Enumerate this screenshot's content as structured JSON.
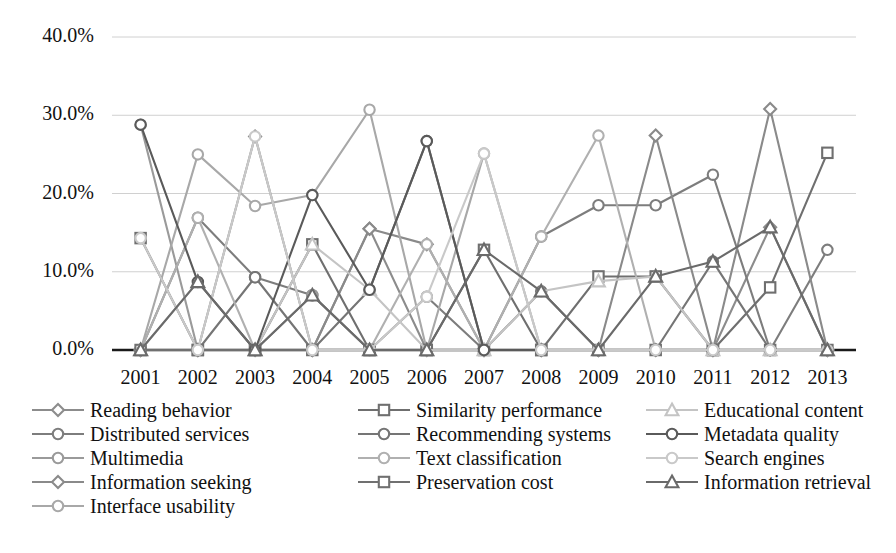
{
  "chart_data": {
    "type": "line",
    "title": "",
    "xlabel": "",
    "ylabel": "",
    "categories": [
      "2001",
      "2002",
      "2003",
      "2004",
      "2005",
      "2006",
      "2007",
      "2008",
      "2009",
      "2010",
      "2011",
      "2012",
      "2013"
    ],
    "ylim": [
      0,
      40
    ],
    "y_ticks": [
      0,
      10,
      20,
      30,
      40
    ],
    "y_tick_labels": [
      "0.0%",
      "10.0%",
      "20.0%",
      "30.0%",
      "40.0%"
    ],
    "grid": true,
    "legend_position": "bottom",
    "value_suffix": "%",
    "series": [
      {
        "name": "Reading behavior",
        "marker": "diamond",
        "color": "#8c8c8c",
        "values": [
          0.0,
          0.0,
          0.0,
          0.0,
          15.5,
          0.0,
          0.0,
          0.0,
          0.0,
          0.0,
          0.0,
          15.7,
          0.0
        ]
      },
      {
        "name": "Distributed services",
        "marker": "circle",
        "color": "#7d7d7d",
        "values": [
          0.0,
          16.9,
          9.3,
          7.0,
          0.0,
          6.8,
          0.0,
          14.5,
          18.5,
          18.5,
          22.4,
          0.0,
          12.8
        ]
      },
      {
        "name": "Multimedia",
        "marker": "circle",
        "color": "#9a9a9a",
        "values": [
          28.8,
          0.0,
          0.0,
          7.0,
          0.0,
          0.0,
          0.0,
          0.0,
          0.0,
          0.0,
          0.0,
          0.0,
          0.0
        ]
      },
      {
        "name": "Information seeking",
        "marker": "diamond",
        "color": "#8a8a8a",
        "values": [
          0.0,
          0.0,
          27.3,
          0.0,
          15.5,
          13.5,
          0.0,
          0.0,
          0.0,
          27.4,
          0.0,
          30.8,
          0.0
        ]
      },
      {
        "name": "Interface usability",
        "marker": "circle",
        "color": "#a8a8a8",
        "values": [
          0.0,
          25.0,
          18.4,
          19.8,
          30.7,
          0.0,
          25.1,
          0.0,
          0.0,
          0.0,
          0.0,
          0.0,
          0.0
        ]
      },
      {
        "name": "Similarity performance",
        "marker": "square",
        "color": "#6f6f6f",
        "values": [
          14.3,
          0.0,
          0.0,
          13.5,
          0.0,
          0.0,
          12.8,
          0.0,
          9.4,
          9.4,
          0.0,
          8.0,
          25.2
        ]
      },
      {
        "name": "Recommending systems",
        "marker": "circle",
        "color": "#757575",
        "values": [
          0.0,
          0.0,
          9.3,
          0.0,
          7.7,
          26.7,
          0.0,
          7.5,
          0.0,
          0.0,
          11.3,
          0.0,
          0.0
        ]
      },
      {
        "name": "Text classification",
        "marker": "circle",
        "color": "#b0b0b0",
        "values": [
          0.0,
          16.9,
          0.0,
          0.0,
          0.0,
          13.5,
          0.0,
          14.5,
          27.4,
          0.0,
          0.0,
          0.0,
          0.0
        ]
      },
      {
        "name": "Preservation cost",
        "marker": "square",
        "color": "#707070",
        "values": [
          0.0,
          0.0,
          0.0,
          0.0,
          0.0,
          0.0,
          0.0,
          0.0,
          0.0,
          0.0,
          0.0,
          0.0,
          0.0
        ]
      },
      {
        "name": "Educational content",
        "marker": "triangle",
        "color": "#c4c4c4",
        "values": [
          0.0,
          8.7,
          0.0,
          13.5,
          7.7,
          0.0,
          0.0,
          7.5,
          8.8,
          9.4,
          0.0,
          0.0,
          0.0
        ]
      },
      {
        "name": "Metadata quality",
        "marker": "circle",
        "color": "#5a5a5a",
        "values": [
          28.8,
          8.7,
          0.0,
          19.8,
          7.7,
          26.7,
          0.0,
          0.0,
          0.0,
          0.0,
          0.0,
          0.0,
          0.0
        ]
      },
      {
        "name": "Search engines",
        "marker": "circle",
        "color": "#c9c9c9",
        "values": [
          14.3,
          0.0,
          27.3,
          0.0,
          0.0,
          6.8,
          25.1,
          0.0,
          0.0,
          0.0,
          0.0,
          0.0,
          0.0
        ]
      },
      {
        "name": "Information retrieval",
        "marker": "triangle",
        "color": "#6a6a6a",
        "values": [
          0.0,
          8.7,
          0.0,
          7.0,
          0.0,
          0.0,
          12.8,
          7.5,
          0.0,
          9.4,
          11.3,
          15.7,
          0.0
        ]
      }
    ]
  },
  "legend": {
    "columns": [
      [
        "Reading behavior",
        "Distributed services",
        "Multimedia",
        "Information seeking",
        "Interface usability"
      ],
      [
        "Similarity performance",
        "Recommending systems",
        "Text classification",
        "Preservation cost"
      ],
      [
        "Educational content",
        "Metadata quality",
        "Search engines",
        "Information retrieval"
      ]
    ]
  }
}
